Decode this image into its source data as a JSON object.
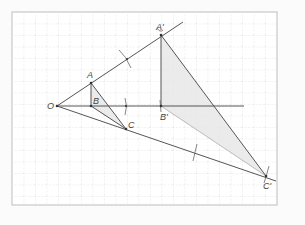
{
  "figure": {
    "type": "geometric construction (homothety / enlargement from centre O)",
    "background": "#fbfbfb",
    "frame": {
      "x": 12,
      "y": 12,
      "w": 265,
      "h": 193,
      "stroke": "#bdbdbd",
      "fill": "#ffffff"
    },
    "grid": {
      "spacing": 11.5,
      "color": "#cfcfcf",
      "dashed": true
    },
    "colors": {
      "line": "#555555",
      "shade": "#e8e8e8",
      "label": "#444444"
    },
    "points": {
      "O": {
        "label": "O",
        "x": 57,
        "y": 106
      },
      "A": {
        "label": "A",
        "x": 91,
        "y": 83
      },
      "B": {
        "label": "B",
        "x": 91,
        "y": 106
      },
      "C": {
        "label": "C",
        "x": 126,
        "y": 129
      },
      "A_prime": {
        "label": "A'",
        "x": 161,
        "y": 35
      },
      "B_prime": {
        "label": "B'",
        "x": 161,
        "y": 106
      },
      "C_prime": {
        "label": "C'",
        "x": 266,
        "y": 176
      }
    },
    "rays": [
      {
        "name": "ray-OA",
        "from": [
          57,
          106
        ],
        "to": [
          183,
          22
        ]
      },
      {
        "name": "ray-OB",
        "from": [
          57,
          106
        ],
        "to": [
          244,
          106
        ]
      },
      {
        "name": "ray-OC",
        "from": [
          57,
          106
        ],
        "to": [
          276,
          181
        ]
      }
    ],
    "compass_arcs": [
      {
        "name": "arc-on-OA",
        "x": 127,
        "y": 58
      },
      {
        "name": "arc-on-OB",
        "x": 126,
        "y": 106
      },
      {
        "name": "arc-on-OC",
        "x": 195,
        "y": 153
      },
      {
        "name": "arc-at-C-prime",
        "x": 267,
        "y": 175
      },
      {
        "name": "arc-at-A-prime",
        "x": 161,
        "y": 35
      }
    ]
  }
}
